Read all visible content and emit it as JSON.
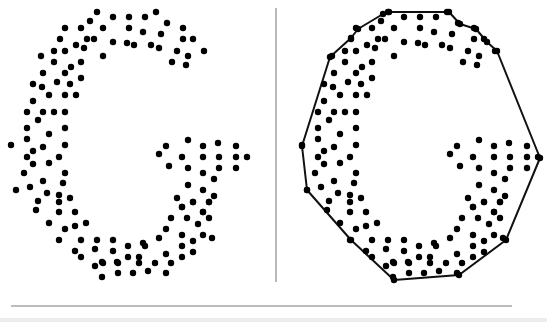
{
  "figure": {
    "panels": [
      {
        "id": "left",
        "label": "point-set",
        "offset_x": 0
      },
      {
        "id": "right",
        "label": "point-set-with-convex-hull",
        "offset_x": 291
      }
    ],
    "dot_radius": 3.2,
    "dot_color": "#000000",
    "hull_color": "#111111",
    "hull_width": 2,
    "divider": {
      "x": 276,
      "y1": 8,
      "y2": 282,
      "color": "#8a8a8a"
    },
    "rule": {
      "x1": 11,
      "x2": 512,
      "y": 306,
      "color": "#7a7a7a"
    },
    "points": [
      [
        97,
        12
      ],
      [
        113,
        17
      ],
      [
        129,
        17
      ],
      [
        145,
        17
      ],
      [
        156,
        12
      ],
      [
        90,
        21
      ],
      [
        167,
        23
      ],
      [
        65,
        28
      ],
      [
        81,
        28
      ],
      [
        103,
        28
      ],
      [
        129,
        28
      ],
      [
        143,
        32
      ],
      [
        183,
        28
      ],
      [
        161,
        34
      ],
      [
        60,
        39
      ],
      [
        87,
        39
      ],
      [
        94,
        39
      ],
      [
        113,
        42
      ],
      [
        127,
        43
      ],
      [
        134,
        45
      ],
      [
        151,
        45
      ],
      [
        159,
        48
      ],
      [
        183,
        39
      ],
      [
        193,
        39
      ],
      [
        76,
        45
      ],
      [
        84,
        48
      ],
      [
        54,
        51
      ],
      [
        65,
        51
      ],
      [
        177,
        51
      ],
      [
        204,
        51
      ],
      [
        41,
        56
      ],
      [
        103,
        56
      ],
      [
        188,
        56
      ],
      [
        54,
        62
      ],
      [
        81,
        62
      ],
      [
        172,
        62
      ],
      [
        186,
        65
      ],
      [
        71,
        67
      ],
      [
        43,
        73
      ],
      [
        65,
        73
      ],
      [
        81,
        78
      ],
      [
        33,
        84
      ],
      [
        42,
        87
      ],
      [
        57,
        82
      ],
      [
        70,
        84
      ],
      [
        49,
        95
      ],
      [
        65,
        95
      ],
      [
        76,
        95
      ],
      [
        33,
        101
      ],
      [
        27,
        112
      ],
      [
        43,
        112
      ],
      [
        54,
        112
      ],
      [
        65,
        112
      ],
      [
        38,
        120
      ],
      [
        27,
        128
      ],
      [
        65,
        128
      ],
      [
        49,
        134
      ],
      [
        27,
        139
      ],
      [
        11,
        145
      ],
      [
        43,
        147
      ],
      [
        65,
        145
      ],
      [
        33,
        151
      ],
      [
        27,
        157
      ],
      [
        59,
        157
      ],
      [
        33,
        164
      ],
      [
        49,
        163
      ],
      [
        24,
        173
      ],
      [
        65,
        173
      ],
      [
        43,
        181
      ],
      [
        63,
        183
      ],
      [
        16,
        190
      ],
      [
        30,
        187
      ],
      [
        47,
        193
      ],
      [
        59,
        195
      ],
      [
        59,
        202
      ],
      [
        70,
        198
      ],
      [
        38,
        201
      ],
      [
        36,
        210
      ],
      [
        59,
        212
      ],
      [
        75,
        212
      ],
      [
        49,
        223
      ],
      [
        65,
        229
      ],
      [
        75,
        226
      ],
      [
        86,
        223
      ],
      [
        59,
        240
      ],
      [
        81,
        240
      ],
      [
        97,
        240
      ],
      [
        113,
        240
      ],
      [
        75,
        251
      ],
      [
        81,
        257
      ],
      [
        95,
        249
      ],
      [
        113,
        251
      ],
      [
        95,
        266
      ],
      [
        102,
        262
      ],
      [
        117,
        262
      ],
      [
        102,
        277
      ],
      [
        128,
        246
      ],
      [
        143,
        243
      ],
      [
        145,
        246
      ],
      [
        159,
        238
      ],
      [
        128,
        257
      ],
      [
        139,
        257
      ],
      [
        139,
        263
      ],
      [
        103,
        263
      ],
      [
        118,
        263
      ],
      [
        155,
        263
      ],
      [
        118,
        273
      ],
      [
        133,
        273
      ],
      [
        148,
        271
      ],
      [
        166,
        273
      ],
      [
        171,
        263
      ],
      [
        166,
        254
      ],
      [
        166,
        229
      ],
      [
        171,
        218
      ],
      [
        182,
        207
      ],
      [
        187,
        218
      ],
      [
        193,
        202
      ],
      [
        203,
        212
      ],
      [
        209,
        218
      ],
      [
        209,
        202
      ],
      [
        198,
        224
      ],
      [
        182,
        235
      ],
      [
        193,
        241
      ],
      [
        203,
        235
      ],
      [
        212,
        238
      ],
      [
        182,
        246
      ],
      [
        193,
        252
      ],
      [
        182,
        257
      ],
      [
        188,
        140
      ],
      [
        166,
        146
      ],
      [
        203,
        146
      ],
      [
        218,
        143
      ],
      [
        236,
        146
      ],
      [
        159,
        154
      ],
      [
        182,
        157
      ],
      [
        203,
        157
      ],
      [
        219,
        157
      ],
      [
        236,
        157
      ],
      [
        247,
        157
      ],
      [
        169,
        166
      ],
      [
        188,
        168
      ],
      [
        219,
        168
      ],
      [
        236,
        168
      ],
      [
        203,
        173
      ],
      [
        214,
        179
      ],
      [
        188,
        185
      ],
      [
        203,
        190
      ],
      [
        177,
        198
      ],
      [
        214,
        196
      ],
      [
        193,
        202
      ],
      [
        209,
        202
      ],
      [
        182,
        207
      ],
      [
        203,
        212
      ]
    ],
    "hull": [
      [
        389,
        12
      ],
      [
        449,
        12
      ],
      [
        460,
        24
      ],
      [
        476,
        29
      ],
      [
        487,
        42
      ],
      [
        497,
        51
      ],
      [
        540,
        158
      ],
      [
        506,
        240
      ],
      [
        459,
        275
      ],
      [
        394,
        280
      ],
      [
        351,
        240
      ],
      [
        307,
        190
      ],
      [
        302,
        146
      ],
      [
        330,
        57
      ],
      [
        351,
        38
      ],
      [
        358,
        29
      ],
      [
        383,
        14
      ]
    ]
  }
}
